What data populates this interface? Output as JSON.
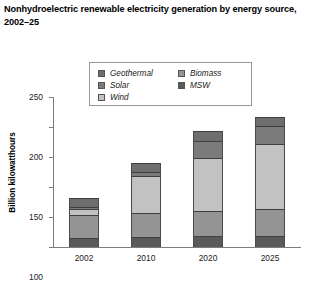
{
  "title": "Nonhydroelectric renewable electricity generation by energy source, 2002–25",
  "legend": {
    "position": "top-center-inside",
    "columns": [
      {
        "items": [
          {
            "label": "Geothermal",
            "color": "#6e6e6e"
          },
          {
            "label": "Solar",
            "color": "#7b7b7b"
          },
          {
            "label": "Wind",
            "color": "#c2c2c2"
          }
        ]
      },
      {
        "items": [
          {
            "label": "Biomass",
            "color": "#949494"
          },
          {
            "label": "MSW",
            "color": "#5a5a5a"
          }
        ]
      }
    ]
  },
  "axes": {
    "ylabel": "Billion kilowatthours",
    "xlabel": "",
    "yticks": [
      0,
      50,
      100,
      150,
      200,
      250
    ],
    "ytick_labels": [
      "0",
      "50",
      "100",
      "150",
      "200",
      "250"
    ],
    "ylim": [
      0,
      250
    ],
    "grid": false
  },
  "chart_data": {
    "type": "bar",
    "subtype": "stacked-bar",
    "title": "Nonhydroelectric renewable electricity generation by energy source, 2002–25",
    "xlabel": "",
    "ylabel": "Billion kilowatthours",
    "ylim": [
      0,
      250
    ],
    "grid": false,
    "legend_position": "top-center-inside",
    "categories": [
      "2002",
      "2010",
      "2020",
      "2025"
    ],
    "stack_order_bottom_to_top": [
      "MSW",
      "Biomass",
      "Wind",
      "Solar",
      "Geothermal"
    ],
    "series": [
      {
        "name": "MSW",
        "color": "#5a5a5a",
        "values": [
          15,
          17,
          18,
          18
        ]
      },
      {
        "name": "Biomass",
        "color": "#949494",
        "values": [
          38,
          40,
          42,
          45
        ]
      },
      {
        "name": "Wind",
        "color": "#c2c2c2",
        "values": [
          11,
          62,
          88,
          108
        ]
      },
      {
        "name": "Solar",
        "color": "#7b7b7b",
        "values": [
          3,
          6,
          28,
          30
        ]
      },
      {
        "name": "Geothermal",
        "color": "#6e6e6e",
        "values": [
          15,
          15,
          17,
          16
        ]
      }
    ],
    "totals": [
      82,
      140,
      193,
      217
    ]
  }
}
